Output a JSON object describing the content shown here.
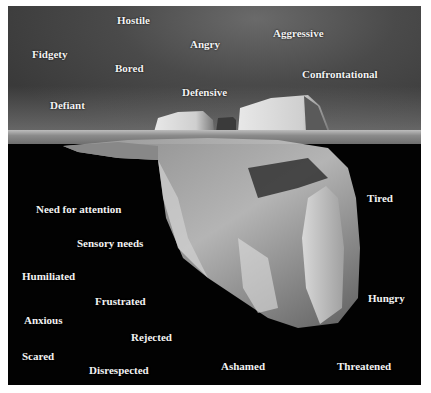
{
  "diagram": {
    "type": "iceberg",
    "colors": {
      "sky": "#4a4a4a",
      "water": "#020202",
      "ice": "#d8d8d8",
      "text": "#f2f2f2",
      "border": "#ffffff"
    },
    "above_surface": {
      "labels": [
        {
          "text": "Hostile",
          "x": 117,
          "y": 14
        },
        {
          "text": "Angry",
          "x": 190,
          "y": 38
        },
        {
          "text": "Aggressive",
          "x": 273,
          "y": 27
        },
        {
          "text": "Fidgety",
          "x": 32,
          "y": 48
        },
        {
          "text": "Bored",
          "x": 115,
          "y": 62
        },
        {
          "text": "Confrontational",
          "x": 302,
          "y": 68
        },
        {
          "text": "Defensive",
          "x": 182,
          "y": 86
        },
        {
          "text": "Defiant",
          "x": 50,
          "y": 99
        }
      ]
    },
    "below_surface": {
      "labels": [
        {
          "text": "Tired",
          "x": 367,
          "y": 192
        },
        {
          "text": "Need for attention",
          "x": 36,
          "y": 203
        },
        {
          "text": "Sensory needs",
          "x": 77,
          "y": 237
        },
        {
          "text": "Humiliated",
          "x": 22,
          "y": 270
        },
        {
          "text": "Frustrated",
          "x": 95,
          "y": 295
        },
        {
          "text": "Hungry",
          "x": 368,
          "y": 292
        },
        {
          "text": "Anxious",
          "x": 24,
          "y": 314
        },
        {
          "text": "Rejected",
          "x": 131,
          "y": 331
        },
        {
          "text": "Scared",
          "x": 22,
          "y": 350
        },
        {
          "text": "Disrespected",
          "x": 89,
          "y": 364
        },
        {
          "text": "Ashamed",
          "x": 221,
          "y": 360
        },
        {
          "text": "Threatened",
          "x": 337,
          "y": 360
        }
      ]
    }
  }
}
